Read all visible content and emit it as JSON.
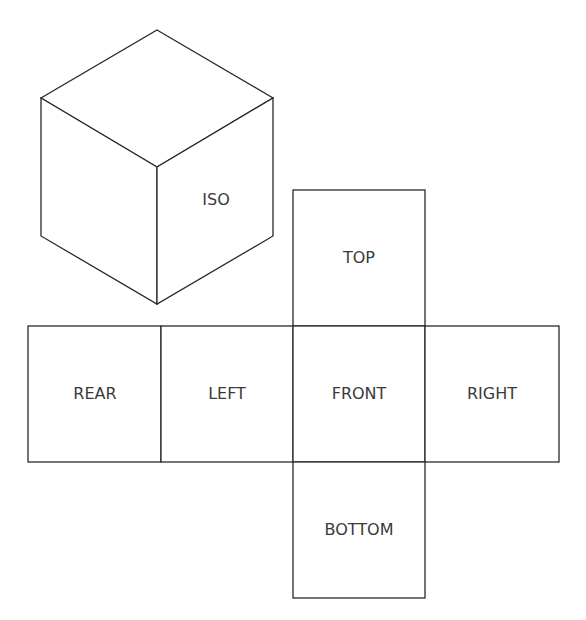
{
  "diagram": {
    "type": "cube-net-with-isometric-view",
    "iso_cube": {
      "label": "ISO",
      "vertices": {
        "top": [
          157,
          30
        ],
        "left_top": [
          41,
          98
        ],
        "right_top": [
          273,
          98
        ],
        "center": [
          157,
          167
        ],
        "left_bottom": [
          41,
          236
        ],
        "right_bottom": [
          273,
          236
        ],
        "bottom": [
          157,
          304
        ]
      }
    },
    "net": {
      "faces": [
        {
          "id": "top",
          "label": "TOP",
          "x": 293,
          "y": 190,
          "w": 132,
          "h": 136
        },
        {
          "id": "rear",
          "label": "REAR",
          "x": 28,
          "y": 326,
          "w": 133,
          "h": 136
        },
        {
          "id": "left",
          "label": "LEFT",
          "x": 161,
          "y": 326,
          "w": 132,
          "h": 136
        },
        {
          "id": "front",
          "label": "FRONT",
          "x": 293,
          "y": 326,
          "w": 132,
          "h": 136
        },
        {
          "id": "right",
          "label": "RIGHT",
          "x": 425,
          "y": 326,
          "w": 134,
          "h": 136
        },
        {
          "id": "bottom",
          "label": "BOTTOM",
          "x": 293,
          "y": 462,
          "w": 132,
          "h": 136
        }
      ]
    }
  }
}
